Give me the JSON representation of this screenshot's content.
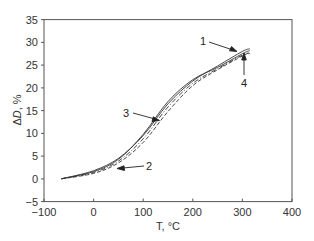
{
  "chart_data": {
    "type": "line",
    "title": "",
    "xlabel": "T, °C",
    "ylabel": "ΔD, %",
    "xlim": [
      -100,
      400
    ],
    "ylim": [
      -5,
      35
    ],
    "xticks": [
      -100,
      0,
      100,
      200,
      300,
      400
    ],
    "yticks": [
      -5,
      0,
      5,
      10,
      15,
      20,
      25,
      30,
      35
    ],
    "grid": false,
    "legend": "none (numbered curve labels with arrows)",
    "series": [
      {
        "name": "1",
        "style": "solid",
        "x": [
          -65,
          0,
          50,
          100,
          150,
          200,
          250,
          300,
          315
        ],
        "y": [
          0,
          1.8,
          4.5,
          9.5,
          16.5,
          21.5,
          24.8,
          28.0,
          28.6
        ]
      },
      {
        "name": "2",
        "style": "dashed",
        "x": [
          -65,
          0,
          50,
          100,
          150,
          200,
          250,
          300,
          315
        ],
        "y": [
          0,
          1.2,
          3.5,
          8.0,
          14.8,
          20.5,
          24.0,
          27.0,
          27.8
        ]
      },
      {
        "name": "3",
        "style": "solid",
        "x": [
          -65,
          0,
          50,
          100,
          150,
          200,
          250,
          300,
          315
        ],
        "y": [
          0,
          1.6,
          4.3,
          9.8,
          17.0,
          21.8,
          24.5,
          27.5,
          28.2
        ]
      },
      {
        "name": "4",
        "style": "dash-dot",
        "x": [
          -65,
          0,
          50,
          100,
          150,
          200,
          250,
          300,
          315
        ],
        "y": [
          0,
          1.4,
          3.9,
          8.8,
          15.8,
          21.0,
          24.2,
          27.2,
          27.6
        ]
      }
    ],
    "annotations": [
      {
        "text": "1",
        "pointing_to": [
          285,
          28.5
        ]
      },
      {
        "text": "2",
        "pointing_to": [
          50,
          2.4
        ]
      },
      {
        "text": "3",
        "pointing_to": [
          135,
          13
        ]
      },
      {
        "text": "4",
        "pointing_to": [
          300,
          27.3
        ]
      }
    ]
  },
  "axes": {
    "xlabel": "T, °C",
    "ylabel": "ΔD, %",
    "xtick_labels": [
      "−100",
      "0",
      "100",
      "200",
      "300",
      "400"
    ],
    "ytick_labels": [
      "−5",
      "0",
      "5",
      "10",
      "15",
      "20",
      "25",
      "30",
      "35"
    ]
  },
  "labels": {
    "c1": "1",
    "c2": "2",
    "c3": "3",
    "c4": "4"
  }
}
